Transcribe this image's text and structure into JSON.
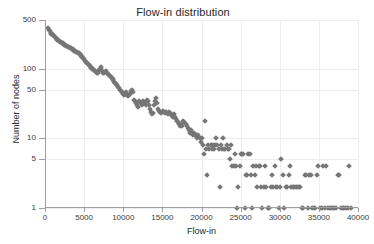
{
  "chart_data": {
    "type": "scatter",
    "title": "Flow-in distribution",
    "xlabel": "Flow-in",
    "ylabel": "Number of nodes",
    "xlim": [
      0,
      40000
    ],
    "ylim": [
      1,
      500
    ],
    "yscale": "log",
    "xscale": "linear",
    "grid": true,
    "legend": null,
    "marker": {
      "shape": "diamond",
      "color": "#767676",
      "size": 4
    },
    "xticks": [
      0,
      5000,
      10000,
      15000,
      20000,
      25000,
      30000,
      35000,
      40000
    ],
    "xtick_labels": [
      "0",
      "5000",
      "10000",
      "15000",
      "20000",
      "25000",
      "30000",
      "35000",
      "40000"
    ],
    "yticks": [
      1,
      5,
      10,
      50,
      100,
      500
    ],
    "ytick_labels": [
      "1",
      "5",
      "10",
      "50",
      "100",
      "500"
    ],
    "points": [
      [
        400,
        380
      ],
      [
        520,
        360
      ],
      [
        620,
        345
      ],
      [
        720,
        330
      ],
      [
        820,
        320
      ],
      [
        930,
        310
      ],
      [
        1030,
        300
      ],
      [
        1140,
        290
      ],
      [
        1250,
        285
      ],
      [
        1360,
        278
      ],
      [
        1470,
        270
      ],
      [
        1580,
        262
      ],
      [
        1700,
        258
      ],
      [
        1810,
        252
      ],
      [
        1920,
        245
      ],
      [
        2040,
        240
      ],
      [
        2150,
        236
      ],
      [
        2260,
        230
      ],
      [
        2380,
        226
      ],
      [
        2490,
        222
      ],
      [
        2600,
        218
      ],
      [
        2720,
        214
      ],
      [
        2830,
        210
      ],
      [
        2950,
        205
      ],
      [
        3060,
        202
      ],
      [
        3180,
        198
      ],
      [
        3290,
        195
      ],
      [
        3400,
        192
      ],
      [
        3520,
        190
      ],
      [
        3630,
        186
      ],
      [
        3750,
        182
      ],
      [
        3860,
        180
      ],
      [
        3980,
        176
      ],
      [
        4090,
        172
      ],
      [
        4200,
        170
      ],
      [
        4320,
        166
      ],
      [
        4430,
        162
      ],
      [
        4550,
        158
      ],
      [
        4660,
        152
      ],
      [
        4780,
        148
      ],
      [
        4900,
        142
      ],
      [
        5010,
        138
      ],
      [
        5130,
        130
      ],
      [
        5240,
        124
      ],
      [
        5360,
        120
      ],
      [
        5470,
        115
      ],
      [
        5590,
        112
      ],
      [
        5700,
        108
      ],
      [
        5820,
        105
      ],
      [
        5940,
        102
      ],
      [
        6050,
        100
      ],
      [
        6170,
        98
      ],
      [
        6280,
        95
      ],
      [
        6400,
        92
      ],
      [
        6520,
        90
      ],
      [
        6630,
        88
      ],
      [
        6750,
        86
      ],
      [
        6870,
        95
      ],
      [
        6980,
        100
      ],
      [
        7100,
        105
      ],
      [
        7220,
        98
      ],
      [
        7330,
        92
      ],
      [
        7450,
        88
      ],
      [
        7570,
        86
      ],
      [
        7690,
        90
      ],
      [
        7800,
        92
      ],
      [
        7920,
        88
      ],
      [
        8040,
        84
      ],
      [
        8160,
        80
      ],
      [
        8270,
        78
      ],
      [
        8390,
        76
      ],
      [
        8510,
        74
      ],
      [
        8630,
        70
      ],
      [
        8750,
        68
      ],
      [
        8860,
        65
      ],
      [
        8980,
        62
      ],
      [
        9100,
        60
      ],
      [
        9220,
        58
      ],
      [
        9340,
        55
      ],
      [
        9460,
        52
      ],
      [
        9580,
        50
      ],
      [
        9700,
        48
      ],
      [
        9820,
        46
      ],
      [
        9940,
        44
      ],
      [
        10060,
        42
      ],
      [
        10180,
        44
      ],
      [
        10300,
        46
      ],
      [
        10420,
        44
      ],
      [
        10540,
        42
      ],
      [
        10660,
        40
      ],
      [
        10780,
        42
      ],
      [
        10900,
        44
      ],
      [
        11020,
        48
      ],
      [
        11150,
        50
      ],
      [
        11270,
        46
      ],
      [
        11390,
        36
      ],
      [
        11510,
        34
      ],
      [
        11640,
        32
      ],
      [
        11760,
        30
      ],
      [
        11880,
        28
      ],
      [
        12010,
        34
      ],
      [
        12130,
        33
      ],
      [
        12260,
        32
      ],
      [
        12380,
        30
      ],
      [
        12510,
        34
      ],
      [
        12630,
        33
      ],
      [
        12760,
        32
      ],
      [
        12880,
        30
      ],
      [
        13010,
        36
      ],
      [
        13130,
        34
      ],
      [
        13260,
        30
      ],
      [
        13380,
        26
      ],
      [
        13510,
        24
      ],
      [
        13640,
        22
      ],
      [
        13760,
        23
      ],
      [
        13890,
        30
      ],
      [
        14020,
        34
      ],
      [
        14140,
        38
      ],
      [
        14270,
        32
      ],
      [
        14400,
        26
      ],
      [
        14530,
        25
      ],
      [
        14660,
        24
      ],
      [
        14790,
        23
      ],
      [
        14920,
        24
      ],
      [
        15050,
        25
      ],
      [
        15180,
        24
      ],
      [
        15310,
        23
      ],
      [
        15440,
        24
      ],
      [
        15570,
        23
      ],
      [
        15700,
        22
      ],
      [
        15830,
        24
      ],
      [
        15960,
        23
      ],
      [
        16090,
        22
      ],
      [
        16220,
        21
      ],
      [
        16350,
        20
      ],
      [
        16490,
        22
      ],
      [
        16620,
        20
      ],
      [
        16750,
        19
      ],
      [
        16880,
        18
      ],
      [
        17020,
        17
      ],
      [
        17150,
        16
      ],
      [
        17280,
        15
      ],
      [
        17420,
        16
      ],
      [
        17550,
        15
      ],
      [
        17690,
        18
      ],
      [
        17820,
        17
      ],
      [
        17960,
        16
      ],
      [
        18090,
        15
      ],
      [
        18230,
        14
      ],
      [
        18370,
        13
      ],
      [
        18500,
        12
      ],
      [
        18640,
        13
      ],
      [
        18780,
        12
      ],
      [
        18920,
        11
      ],
      [
        19050,
        12
      ],
      [
        19190,
        11
      ],
      [
        19330,
        11
      ],
      [
        19470,
        10
      ],
      [
        19610,
        11
      ],
      [
        19750,
        10
      ],
      [
        19890,
        9
      ],
      [
        20030,
        10
      ],
      [
        20170,
        8
      ],
      [
        20310,
        6
      ],
      [
        20450,
        18
      ],
      [
        20590,
        7
      ],
      [
        20730,
        3
      ],
      [
        20870,
        8
      ],
      [
        21010,
        7
      ],
      [
        21160,
        8
      ],
      [
        21300,
        7
      ],
      [
        21450,
        8
      ],
      [
        21590,
        7
      ],
      [
        21740,
        8
      ],
      [
        21880,
        10
      ],
      [
        22030,
        8
      ],
      [
        22180,
        7
      ],
      [
        22320,
        2
      ],
      [
        22470,
        8
      ],
      [
        22620,
        7
      ],
      [
        22760,
        10
      ],
      [
        22910,
        7
      ],
      [
        23060,
        7
      ],
      [
        23210,
        8
      ],
      [
        23360,
        7
      ],
      [
        23510,
        7
      ],
      [
        23660,
        5
      ],
      [
        23810,
        8
      ],
      [
        23960,
        4
      ],
      [
        24110,
        4
      ],
      [
        24260,
        6
      ],
      [
        24420,
        4
      ],
      [
        24570,
        1
      ],
      [
        24720,
        2
      ],
      [
        24880,
        4
      ],
      [
        25030,
        6
      ],
      [
        25190,
        6
      ],
      [
        25350,
        6
      ],
      [
        25500,
        1
      ],
      [
        25660,
        3
      ],
      [
        25820,
        3
      ],
      [
        25980,
        6
      ],
      [
        26140,
        6
      ],
      [
        26300,
        3
      ],
      [
        26470,
        1
      ],
      [
        26630,
        4
      ],
      [
        26790,
        3
      ],
      [
        26960,
        4
      ],
      [
        27120,
        2
      ],
      [
        27290,
        4
      ],
      [
        27460,
        4
      ],
      [
        27620,
        2
      ],
      [
        27790,
        1
      ],
      [
        27960,
        2
      ],
      [
        28130,
        4
      ],
      [
        28300,
        2
      ],
      [
        28470,
        1
      ],
      [
        28640,
        1
      ],
      [
        28820,
        2
      ],
      [
        28990,
        3
      ],
      [
        29160,
        2
      ],
      [
        29340,
        4
      ],
      [
        29510,
        2
      ],
      [
        29690,
        2
      ],
      [
        29860,
        1
      ],
      [
        30040,
        2
      ],
      [
        30220,
        5
      ],
      [
        30400,
        3
      ],
      [
        30580,
        1
      ],
      [
        30760,
        2
      ],
      [
        30940,
        2
      ],
      [
        31120,
        3
      ],
      [
        31300,
        4
      ],
      [
        31490,
        2
      ],
      [
        31670,
        2
      ],
      [
        31860,
        2
      ],
      [
        32040,
        2
      ],
      [
        32230,
        2
      ],
      [
        32420,
        2
      ],
      [
        32610,
        2
      ],
      [
        32800,
        1
      ],
      [
        32990,
        1
      ],
      [
        33180,
        3
      ],
      [
        33370,
        3
      ],
      [
        33560,
        1
      ],
      [
        33760,
        3
      ],
      [
        33950,
        3
      ],
      [
        34150,
        1
      ],
      [
        34340,
        1
      ],
      [
        34540,
        1
      ],
      [
        34740,
        3
      ],
      [
        34940,
        4
      ],
      [
        35140,
        1
      ],
      [
        35340,
        1
      ],
      [
        35540,
        4
      ],
      [
        35740,
        1
      ],
      [
        35950,
        4
      ],
      [
        36150,
        1
      ],
      [
        36360,
        1
      ],
      [
        36560,
        1
      ],
      [
        36770,
        1
      ],
      [
        36980,
        1
      ],
      [
        37190,
        1
      ],
      [
        37400,
        3
      ],
      [
        37610,
        3
      ],
      [
        37830,
        1
      ],
      [
        38040,
        1
      ],
      [
        38260,
        1
      ],
      [
        38470,
        1
      ],
      [
        38690,
        1
      ],
      [
        38910,
        4
      ],
      [
        39130,
        1
      ]
    ]
  }
}
